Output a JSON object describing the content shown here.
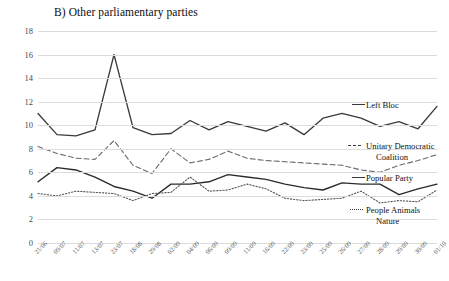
{
  "chart_data": {
    "type": "line",
    "title": "B) Other parliamentary parties",
    "xlabel": "",
    "ylabel": "",
    "ylim": [
      0,
      18
    ],
    "ytick_step": 2,
    "yticks": [
      "0",
      "2",
      "4",
      "6",
      "8",
      "10",
      "12",
      "14",
      "16",
      "18"
    ],
    "grid": true,
    "legend_position": "right-inline",
    "categories": [
      "21/06",
      "09/07",
      "11/07",
      "13/07",
      "23/07",
      "18/08",
      "29/08",
      "02/09",
      "04/09",
      "06/09",
      "09/09",
      "11/09",
      "16/09",
      "22/09",
      "23/09",
      "25/09",
      "26/09",
      "27/09",
      "28/09",
      "29/09",
      "30/09",
      "01/10"
    ],
    "series": [
      {
        "name": "Left Bloc",
        "style": "solid",
        "color": "#3a3a3a",
        "values": [
          11.0,
          9.2,
          9.1,
          9.6,
          16.0,
          9.8,
          9.2,
          9.3,
          10.4,
          9.6,
          10.3,
          9.9,
          9.5,
          10.2,
          9.2,
          10.6,
          11.0,
          10.6,
          9.9,
          10.3,
          9.7,
          11.6
        ]
      },
      {
        "name": "Unitary Democratic Coalition",
        "style": "dashed",
        "color": "#6b6b6b",
        "values": [
          8.2,
          7.6,
          7.2,
          7.1,
          8.7,
          6.6,
          5.9,
          8.0,
          6.8,
          7.1,
          7.8,
          7.2,
          7.0,
          6.9,
          6.8,
          6.7,
          6.6,
          6.2,
          6.0,
          6.6,
          7.0,
          7.5
        ]
      },
      {
        "name": "Popular Party",
        "style": "solid",
        "color": "#2b2b2b",
        "values": [
          5.2,
          6.4,
          6.2,
          5.6,
          4.8,
          4.4,
          3.8,
          5.0,
          5.0,
          5.2,
          5.8,
          5.6,
          5.4,
          5.0,
          4.7,
          4.5,
          5.1,
          5.0,
          5.0,
          4.1,
          4.6,
          5.0
        ]
      },
      {
        "name": "People Animals Nature",
        "style": "dotted",
        "color": "#555555",
        "values": [
          4.2,
          4.0,
          4.4,
          4.3,
          4.2,
          3.6,
          4.2,
          4.3,
          5.6,
          4.4,
          4.5,
          5.0,
          4.6,
          3.8,
          3.6,
          3.7,
          3.8,
          4.4,
          3.4,
          3.6,
          3.5,
          4.5
        ]
      }
    ],
    "legend": [
      {
        "label": "Left Bloc",
        "style": "solid"
      },
      {
        "label": "Unitary Democratic",
        "label2": "Coalition",
        "style": "dashed"
      },
      {
        "label": "Popular Party",
        "style": "solid"
      },
      {
        "label": "People Animals",
        "label2": "Nature",
        "style": "dotted"
      }
    ]
  }
}
